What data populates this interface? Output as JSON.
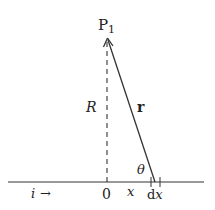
{
  "diagram": {
    "point_label": "P",
    "point_subscript": "1",
    "distance_label": "R",
    "vector_label": "r",
    "angle_label": "θ",
    "origin_label": "0",
    "position_label": "x",
    "element_label_d": "d",
    "element_label_x": "x",
    "current_label": "i",
    "current_arrow": "→"
  }
}
